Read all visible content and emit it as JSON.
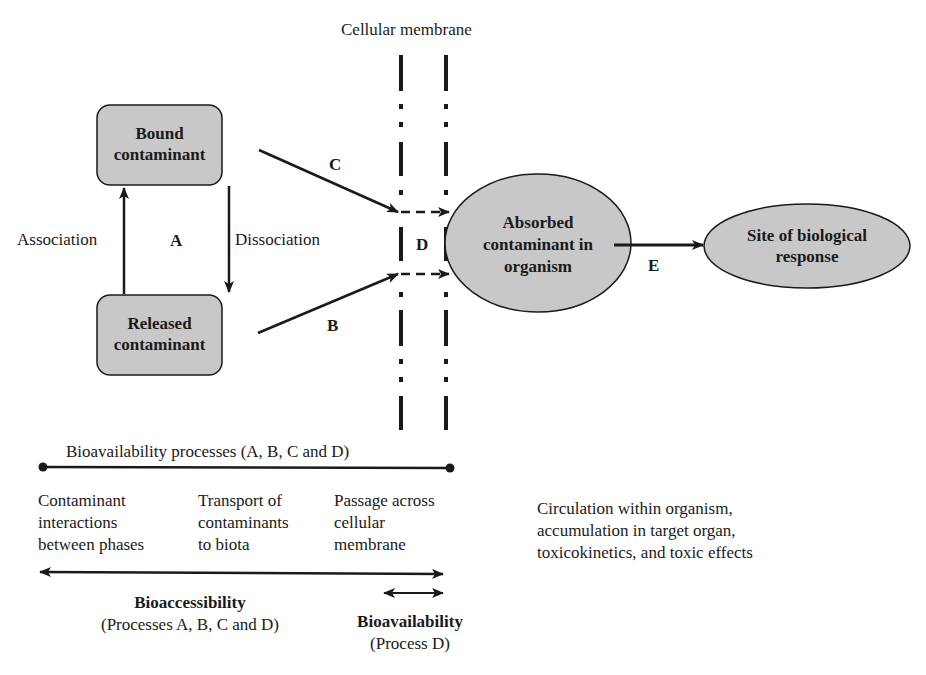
{
  "membrane": {
    "label": "Cellular membrane"
  },
  "nodes": {
    "bound": {
      "line1": "Bound",
      "line2": "contaminant"
    },
    "released": {
      "line1": "Released",
      "line2": "contaminant"
    },
    "absorbed": {
      "line1": "Absorbed",
      "line2": "contaminant in",
      "line3": "organism"
    },
    "site": {
      "line1": "Site of biological",
      "line2": "response"
    }
  },
  "edges": {
    "association": "Association",
    "dissociation": "Dissociation",
    "a": "A",
    "b": "B",
    "c": "C",
    "d": "D",
    "e": "E"
  },
  "scale": {
    "processes_label": "Bioavailability processes (A, B, C and D)",
    "col1": {
      "line1": "Contaminant",
      "line2": "interactions",
      "line3": "between phases"
    },
    "col2": {
      "line1": "Transport of",
      "line2": "contaminants",
      "line3": "to biota"
    },
    "col3": {
      "line1": "Passage across",
      "line2": "cellular",
      "line3": "membrane"
    },
    "bioaccessibility": {
      "title": "Bioaccessibility",
      "sub": "(Processes A, B, C and D)"
    },
    "bioavailability": {
      "title": "Bioavailability",
      "sub": "(Process D)"
    }
  },
  "circulation": {
    "line1": "Circulation within organism,",
    "line2": "accumulation in target organ,",
    "line3": "toxicokinetics, and toxic effects"
  },
  "colors": {
    "fill": "#c8c8c8",
    "stroke": "#1a1a1a"
  }
}
